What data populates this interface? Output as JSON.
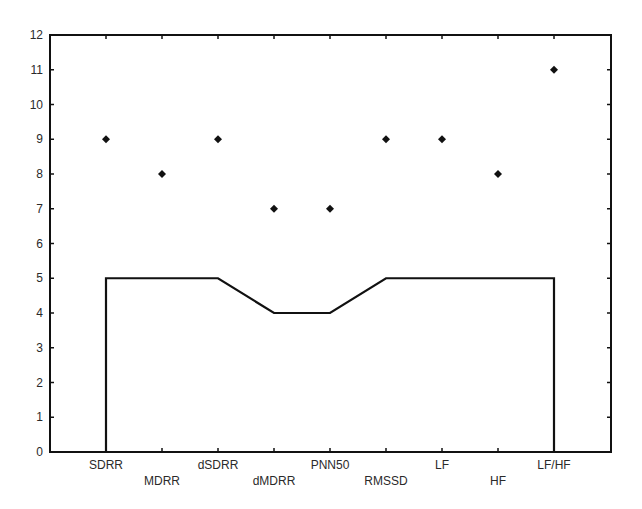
{
  "chart_data": {
    "type": "line",
    "title": "",
    "xlabel": "",
    "ylabel": "",
    "ylim": [
      0,
      12
    ],
    "yticks": [
      0,
      1,
      2,
      3,
      4,
      5,
      6,
      7,
      8,
      9,
      10,
      11,
      12
    ],
    "grid": false,
    "legend": null,
    "categories": [
      "SDRR",
      "MDRR",
      "dSDRR",
      "dMDRR",
      "PNN50",
      "RMSSD",
      "LF",
      "HF",
      "LF/HF"
    ],
    "series": [
      {
        "name": "points",
        "type": "scatter",
        "marker": "diamond",
        "values": [
          9,
          8,
          9,
          7,
          7,
          9,
          9,
          8,
          11
        ]
      },
      {
        "name": "line",
        "type": "line",
        "values": [
          5,
          5,
          5,
          4,
          4,
          5,
          5,
          5,
          5
        ],
        "drop_to_zero_at_ends": true
      }
    ],
    "label_rows": [
      0,
      1,
      0,
      1,
      0,
      1,
      0,
      1,
      0
    ]
  },
  "colors": {
    "ink": "#111111",
    "background": "#ffffff"
  }
}
